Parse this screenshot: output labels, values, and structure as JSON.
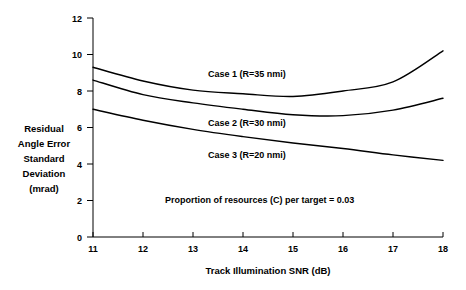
{
  "chart_data": {
    "type": "line",
    "title": "",
    "xlabel": "Track Illumination SNR (dB)",
    "ylabel": "Residual Angle Error Standard Deviation (mrad)",
    "ylabel_lines": [
      "Residual",
      "Angle Error",
      "Standard",
      "Deviation",
      "(mrad)"
    ],
    "xlim": [
      11,
      18
    ],
    "ylim": [
      0,
      12
    ],
    "xticks": [
      11,
      12,
      13,
      14,
      15,
      16,
      17,
      18
    ],
    "xtick_labels": [
      "11",
      "12",
      "13",
      "14",
      "15",
      "16",
      "17",
      "18"
    ],
    "yticks": [
      0,
      2,
      4,
      6,
      8,
      10,
      12
    ],
    "ytick_labels": [
      "0",
      "2",
      "4",
      "6",
      "8",
      "10",
      "12"
    ],
    "grid": false,
    "legend_position": "inline-annotations",
    "x": [
      11,
      12,
      13,
      14,
      15,
      16,
      17,
      18
    ],
    "series": [
      {
        "name": "Case 1 (R=35 nmi)",
        "label": "Case 1 (R=35 nmi)",
        "values": [
          9.3,
          8.55,
          8.05,
          7.85,
          7.7,
          8.0,
          8.5,
          10.2
        ],
        "color": "#000000"
      },
      {
        "name": "Case 2 (R=30 nmi)",
        "label": "Case 2 (R=30 nmi)",
        "values": [
          8.6,
          7.8,
          7.35,
          7.0,
          6.7,
          6.65,
          6.95,
          7.6
        ],
        "color": "#000000"
      },
      {
        "name": "Case 3 (R=20 nmi)",
        "label": "Case 3 (R=20 nmi)",
        "values": [
          7.0,
          6.4,
          5.9,
          5.5,
          5.15,
          4.85,
          4.5,
          4.2
        ],
        "color": "#000000"
      }
    ],
    "annotations": [
      {
        "text": "Case 1 (R=35 nmi)",
        "x": 14.0,
        "y": 8.75
      },
      {
        "text": "Case 2 (R=30 nmi)",
        "x": 14.0,
        "y": 6.05
      },
      {
        "text": "Case 3 (R=20 nmi)",
        "x": 14.0,
        "y": 4.3
      },
      {
        "text": "Proportion of resources (C) per target = 0.03",
        "x": 14.3,
        "y": 2.05
      }
    ]
  },
  "colors": {
    "background": "#ffffff",
    "axis": "#000000",
    "curve": "#000000",
    "text": "#000000"
  }
}
